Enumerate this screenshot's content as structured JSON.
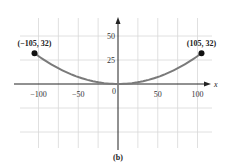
{
  "chart_data": {
    "type": "line",
    "title": "",
    "caption": "(b)",
    "xlabel": "x",
    "ylabel": "",
    "xlim": [
      -125,
      125
    ],
    "ylim": [
      -75,
      70
    ],
    "grid": true,
    "grid_x": [
      -100,
      -75,
      -50,
      -25,
      25,
      50,
      75,
      100
    ],
    "grid_y": [
      -50,
      -25,
      25,
      50
    ],
    "x_ticks": [
      -100,
      -50,
      0,
      50,
      100
    ],
    "x_tick_labels": [
      "−100",
      "−50",
      "0",
      "50",
      "100"
    ],
    "y_ticks": [
      25,
      50
    ],
    "y_tick_labels": [
      "25",
      "50"
    ],
    "series": [
      {
        "name": "parabola",
        "formula": "y = 32 * (x/105)^2",
        "x_range": [
          -105,
          105
        ],
        "color": "#7a7a7a"
      }
    ],
    "points": [
      {
        "x": -105,
        "y": 32,
        "label": "(−105, 32)"
      },
      {
        "x": 105,
        "y": 32,
        "label": "(105, 32)"
      }
    ]
  }
}
